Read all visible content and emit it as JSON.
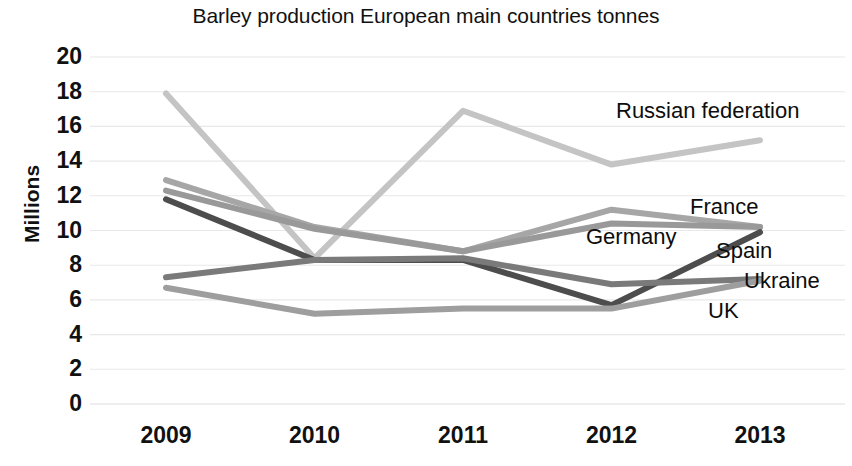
{
  "chart_data": {
    "type": "line",
    "title": "Barley production European main countries tonnes",
    "xlabel": "",
    "ylabel": "Millions",
    "categories": [
      "2009",
      "2010",
      "2011",
      "2012",
      "2013"
    ],
    "x_tick_labels": [
      "2009",
      "2010",
      "2011",
      "2012",
      "2013"
    ],
    "y_tick_labels": [
      "20",
      "18",
      "16",
      "14",
      "12",
      "10",
      "8",
      "6",
      "4",
      "2",
      "0"
    ],
    "y_ticks": [
      20,
      18,
      16,
      14,
      12,
      10,
      8,
      6,
      4,
      2,
      0
    ],
    "ylim": [
      0,
      20
    ],
    "grid": "horizontal",
    "legend": "inline-labels-right",
    "series": [
      {
        "name": "Russian federation",
        "values": [
          17.9,
          8.4,
          16.9,
          13.8,
          15.2
        ],
        "color": "#c4c4c4",
        "label_x": 616,
        "label_y": 100
      },
      {
        "name": "France",
        "values": [
          12.9,
          10.2,
          8.8,
          11.2,
          10.2
        ],
        "color": "#a6a6a6",
        "label_x": 690,
        "label_y": 196
      },
      {
        "name": "Germany",
        "values": [
          12.3,
          10.1,
          8.8,
          10.4,
          10.2
        ],
        "color": "#999999",
        "label_x": 586,
        "label_y": 226
      },
      {
        "name": "Spain",
        "values": [
          11.8,
          8.3,
          8.3,
          5.7,
          9.9
        ],
        "color": "#4d4d4d",
        "label_x": 716,
        "label_y": 240
      },
      {
        "name": "Ukraine",
        "values": [
          7.3,
          8.3,
          8.4,
          6.9,
          7.2
        ],
        "color": "#7a7a7a",
        "label_x": 744,
        "label_y": 270
      },
      {
        "name": "UK",
        "values": [
          6.7,
          5.2,
          5.5,
          5.5,
          7.1
        ],
        "color": "#9e9e9e",
        "label_x": 708,
        "label_y": 300
      }
    ]
  },
  "colors": {
    "gridline": "#e8e8e8",
    "axis_text": "#111111",
    "background": "#ffffff"
  }
}
